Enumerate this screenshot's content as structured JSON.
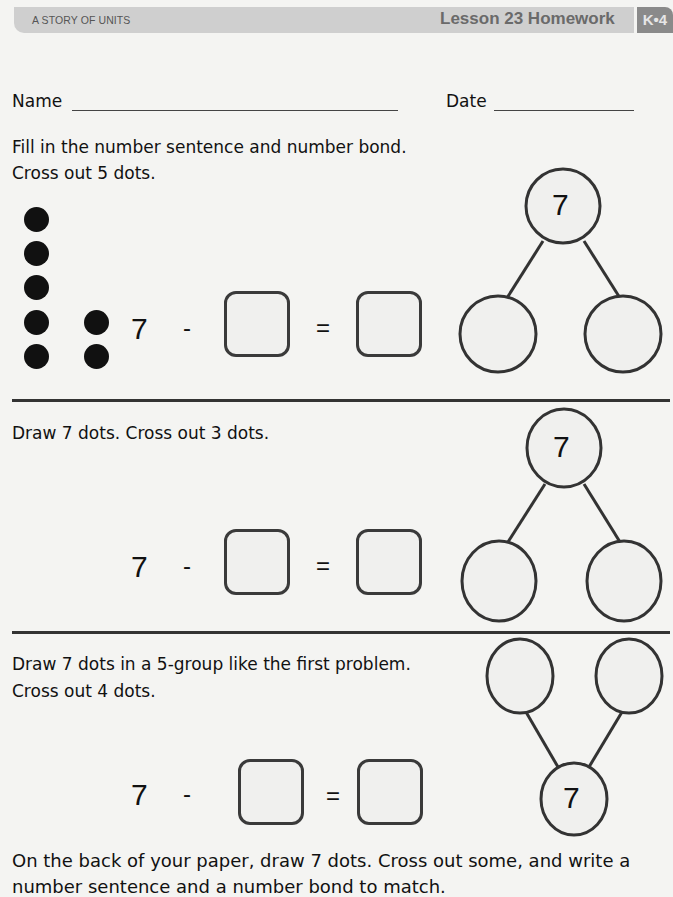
{
  "header": {
    "series": "A STORY OF UNITS",
    "lesson": "Lesson 23 Homework",
    "grade_module": "K•4"
  },
  "student_info": {
    "name_label": "Name",
    "name_value": "",
    "date_label": "Date",
    "date_value": ""
  },
  "problems": [
    {
      "instructions": [
        "Fill in the number sentence and number bond.",
        "Cross out 5 dots."
      ],
      "dots_count": 7,
      "sentence": {
        "whole": "7",
        "minus": "-",
        "equals": "=",
        "box1": "",
        "box2": ""
      },
      "bond": {
        "whole": "7",
        "part1": "",
        "part2": "",
        "orientation": "whole-top"
      }
    },
    {
      "instructions": [
        "Draw 7 dots.  Cross out 3 dots."
      ],
      "sentence": {
        "whole": "7",
        "minus": "-",
        "equals": "=",
        "box1": "",
        "box2": ""
      },
      "bond": {
        "whole": "7",
        "part1": "",
        "part2": "",
        "orientation": "whole-top"
      }
    },
    {
      "instructions": [
        "Draw 7 dots in a 5-group like the first problem.",
        "Cross out 4 dots."
      ],
      "sentence": {
        "whole": "7",
        "minus": "-",
        "equals": "=",
        "box1": "",
        "box2": ""
      },
      "bond": {
        "whole": "7",
        "part1": "",
        "part2": "",
        "orientation": "whole-bottom"
      }
    }
  ],
  "footer_instructions": [
    "On the back of your paper, draw 7 dots.  Cross out some, and write a",
    "number sentence and a number bond to match."
  ]
}
